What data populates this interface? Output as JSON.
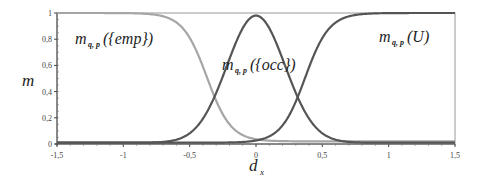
{
  "chart_data": {
    "type": "line",
    "title": "",
    "xlabel": "d_x",
    "ylabel": "m",
    "xlim": [
      -1.5,
      1.5
    ],
    "ylim": [
      0,
      1
    ],
    "x_ticks": [
      "-1,5",
      "-1",
      "-0,5",
      "0",
      "0,5",
      "1",
      "1,5"
    ],
    "y_ticks": [
      "0",
      "0,2",
      "0,4",
      "0,6",
      "0,8",
      "1"
    ],
    "grid": false,
    "legend": "inline annotations",
    "x": [
      -1.5,
      -1.25,
      -1.0,
      -0.75,
      -0.5,
      -0.4,
      -0.37,
      -0.3,
      -0.2,
      -0.1,
      0,
      0.1,
      0.2,
      0.3,
      0.37,
      0.4,
      0.5,
      0.75,
      1.0,
      1.25,
      1.5
    ],
    "series": [
      {
        "name": "m_{q,p}({emp})",
        "color": "#a6a6a6",
        "values": [
          1.0,
          1.0,
          0.99,
          0.93,
          0.72,
          0.56,
          0.5,
          0.36,
          0.18,
          0.07,
          0.03,
          0.02,
          0.02,
          0.02,
          0.02,
          0.02,
          0.02,
          0.02,
          0.02,
          0.02,
          0.02
        ]
      },
      {
        "name": "m_{q,p}({occ})",
        "color": "#555555",
        "values": [
          0.01,
          0.01,
          0.02,
          0.07,
          0.28,
          0.43,
          0.5,
          0.64,
          0.82,
          0.94,
          0.98,
          0.94,
          0.82,
          0.64,
          0.5,
          0.43,
          0.28,
          0.07,
          0.02,
          0.01,
          0.01
        ]
      },
      {
        "name": "m_{q,p}(U)",
        "color": "#555555",
        "values": [
          0.01,
          0.01,
          0.01,
          0.01,
          0.01,
          0.01,
          0.01,
          0.01,
          0.01,
          0.01,
          0.01,
          0.03,
          0.18,
          0.36,
          0.5,
          0.56,
          0.72,
          0.96,
          1.0,
          1.0,
          1.0
        ]
      }
    ],
    "annotations": [
      {
        "text": "m_{q,p}({emp})",
        "x": -1.1,
        "y": 0.8
      },
      {
        "text": "m_{q,p}({occ})",
        "x": 0.0,
        "y": 0.55
      },
      {
        "text": "m_{q,p}(U)",
        "x": 1.05,
        "y": 0.8
      }
    ]
  },
  "labels": {
    "ylabel": "m",
    "xlabel_main": "d",
    "xlabel_sub": "x",
    "emp_main": "m",
    "emp_sub": "q, p",
    "emp_arg": "({emp})",
    "occ_main": "m",
    "occ_sub": "q, p",
    "occ_arg": "({occ})",
    "u_main": "m",
    "u_sub": "q, p",
    "u_arg": "(U)"
  }
}
